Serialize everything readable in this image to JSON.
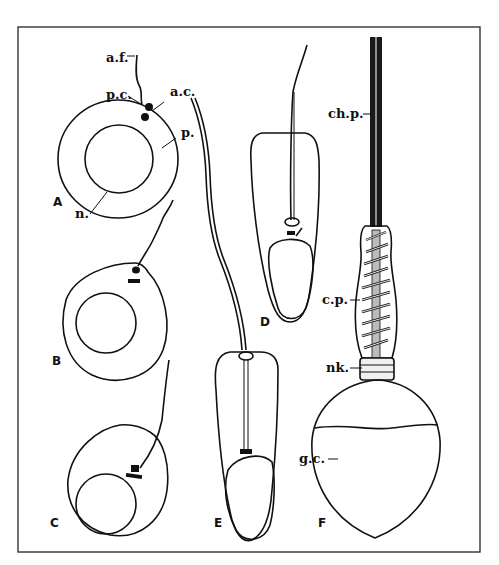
{
  "figure": {
    "panels": [
      {
        "id": "A",
        "label": "A",
        "annotations": [
          {
            "key": "af",
            "text": "a.f."
          },
          {
            "key": "pc",
            "text": "p.c."
          },
          {
            "key": "ac",
            "text": "a.c."
          },
          {
            "key": "p",
            "text": "p."
          },
          {
            "key": "n",
            "text": "n."
          }
        ]
      },
      {
        "id": "B",
        "label": "B"
      },
      {
        "id": "C",
        "label": "C"
      },
      {
        "id": "D",
        "label": "D"
      },
      {
        "id": "E",
        "label": "E"
      },
      {
        "id": "F",
        "label": "F",
        "annotations": [
          {
            "key": "chp",
            "text": "ch.p."
          },
          {
            "key": "cp",
            "text": "c.p."
          },
          {
            "key": "nk",
            "text": "nk."
          },
          {
            "key": "gc",
            "text": "g.c."
          }
        ]
      }
    ]
  }
}
